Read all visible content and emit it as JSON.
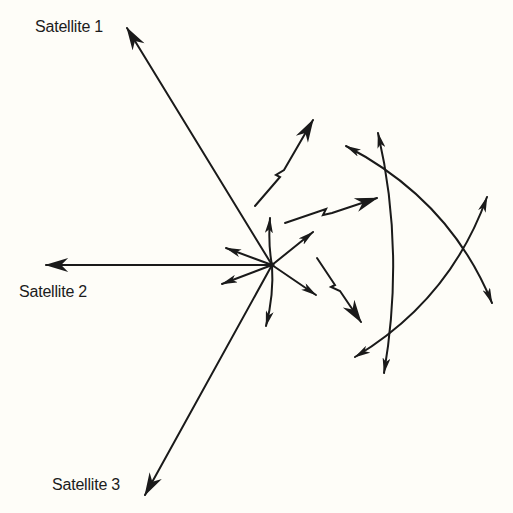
{
  "diagram": {
    "type": "vector-diagram",
    "labels": {
      "satellite_1": "Satellite 1",
      "satellite_2": "Satellite 2",
      "satellite_3": "Satellite 3"
    },
    "colors": {
      "background": "#fefdf8",
      "ink": "#1a1a1a"
    },
    "origin": {
      "x": 272,
      "y": 265
    },
    "elements": [
      {
        "id": "satellite-1-vector",
        "from": [
          272,
          265
        ],
        "to": [
          127,
          27
        ]
      },
      {
        "id": "satellite-2-vector",
        "from": [
          272,
          265
        ],
        "to": [
          46,
          265
        ]
      },
      {
        "id": "satellite-3-vector",
        "from": [
          272,
          265
        ],
        "to": [
          145,
          495
        ]
      },
      {
        "id": "wavy-arrow-upper",
        "description": "zigzag arrow pointing up-right"
      },
      {
        "id": "wavy-arrow-middle",
        "description": "zigzag arrow pointing right"
      },
      {
        "id": "wavy-arrow-lower",
        "description": "zigzag arrow pointing down-right"
      },
      {
        "id": "curved-arrow-vertical",
        "description": "double-headed arc, vertical"
      },
      {
        "id": "curved-arrow-descending",
        "description": "double-headed arc, upper-left to lower-right"
      },
      {
        "id": "curved-arrow-ascending",
        "description": "double-headed arc, lower-left to upper-right"
      }
    ]
  }
}
